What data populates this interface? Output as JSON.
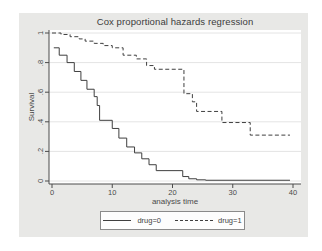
{
  "window": {
    "background": "#ffffff",
    "card_background": "#e8e8e6"
  },
  "chart_data": {
    "type": "line",
    "subtype": "step-survival-curves",
    "title": "Cox proportional hazards regression",
    "xlabel": "analysis time",
    "ylabel": "Survival",
    "xlim": [
      0,
      40
    ],
    "ylim": [
      0,
      1
    ],
    "xticks": [
      0,
      10,
      20,
      30,
      40
    ],
    "yticks": [
      0,
      0.2,
      0.4,
      0.6,
      0.8,
      1
    ],
    "ytick_labels": [
      "0",
      ".2",
      ".4",
      ".6",
      ".8",
      "1"
    ],
    "grid": "horizontal-only",
    "plot_background": "#ffffff",
    "gridline_color": "#e4e4e4",
    "axis_color": "#4a4a4a",
    "line_color": "#3f3f3f",
    "legend_position": "bottom-center",
    "series": [
      {
        "name": "drug=0",
        "line_style": "solid",
        "x": [
          0.3,
          1.2,
          2.5,
          3.7,
          4.8,
          5.8,
          7.0,
          7.5,
          7.9,
          10.0,
          11.1,
          12.4,
          13.7,
          14.9,
          16.1,
          17.3,
          21.7,
          22.7,
          24.0,
          25.5,
          39.5
        ],
        "y": [
          0.9,
          0.85,
          0.8,
          0.74,
          0.68,
          0.62,
          0.57,
          0.51,
          0.41,
          0.355,
          0.29,
          0.23,
          0.19,
          0.15,
          0.11,
          0.07,
          0.03,
          0.015,
          0.008,
          0.005,
          0.005
        ]
      },
      {
        "name": "drug=1",
        "line_style": "dashed",
        "x": [
          0.0,
          1.5,
          3.0,
          4.5,
          5.5,
          7.0,
          8.5,
          10.0,
          11.8,
          14.0,
          15.7,
          17.0,
          21.9,
          23.3,
          24.0,
          28.2,
          32.9,
          39.5
        ],
        "y": [
          1.0,
          0.99,
          0.975,
          0.96,
          0.945,
          0.93,
          0.915,
          0.9,
          0.85,
          0.825,
          0.78,
          0.755,
          0.59,
          0.535,
          0.47,
          0.395,
          0.31,
          0.31
        ]
      }
    ]
  }
}
